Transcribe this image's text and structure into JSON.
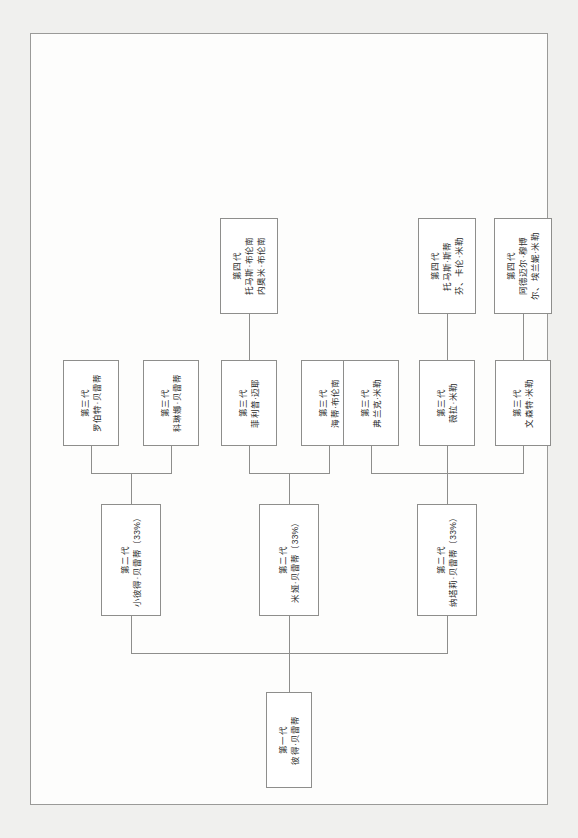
{
  "figure": {
    "caption": "图 5.20  贝蒂家谱：家族分支的股权分布",
    "border_color": "#8e8e8c",
    "page_background": "#fdfdfc"
  },
  "chart_data": {
    "type": "diagram",
    "diagram_type": "family-tree-org-chart",
    "orientation": "landscape-on-portrait-page (rotated 90°)",
    "generations": [
      "第一代",
      "第二代",
      "第三代",
      "第四代"
    ],
    "equity_note": "三个第二代分支各持股 33%"
  },
  "root": {
    "gen": "第一代",
    "name": "彼得·贝雷蒂"
  },
  "gen2": [
    {
      "id": "g2-peter-jr",
      "gen": "第二代",
      "name": "(小彼得·贝雷蒂（33%）",
      "gen_line": "第二代",
      "name_line": "小彼得·贝雷蒂（33%）",
      "equity": "33%"
    },
    {
      "id": "g2-mia",
      "gen": "第二代",
      "gen_line": "第二代",
      "name_line": "米娅·贝雷蒂（33%）",
      "equity": "33%"
    },
    {
      "id": "g2-natalie",
      "gen": "第二代",
      "gen_line": "第二代",
      "name_line": "纳塔莉·贝雷蒂（33%）",
      "equity": "33%"
    }
  ],
  "gen3": [
    {
      "id": "g3-robert",
      "gen_line": "第三代",
      "name_line": "罗伯特·贝雷蒂"
    },
    {
      "id": "g3-corinna",
      "gen_line": "第三代",
      "name_line": "科琳娜·贝雷蒂"
    },
    {
      "id": "g3-philip",
      "gen_line": "第三代",
      "name_line": "菲利普·迈耶"
    },
    {
      "id": "g3-heidi",
      "gen_line": "第三代",
      "name_line": "海蒂·布伦南"
    },
    {
      "id": "g3-frank",
      "gen_line": "第三代",
      "name_line": "弗兰克·米勒"
    },
    {
      "id": "g3-vera",
      "gen_line": "第三代",
      "name_line": "薇拉·米勒"
    },
    {
      "id": "g3-vincent",
      "gen_line": "第三代",
      "name_line": "文森特·米勒"
    }
  ],
  "gen4": [
    {
      "id": "g4-brennan",
      "gen_line": "第四代",
      "name_line": "托马斯·布伦南",
      "name_line2": "内奥米·布伦南"
    },
    {
      "id": "g4-miller-a",
      "gen_line": "第四代",
      "name_line": "托马斯·斯蒂",
      "name_line2": "芬、卡伦·米勒"
    },
    {
      "id": "g4-miller-b",
      "gen_line": "第四代",
      "name_line": "阿德迈尔·穆博",
      "name_line2": "尔、埃兰妮·米勒"
    }
  ]
}
